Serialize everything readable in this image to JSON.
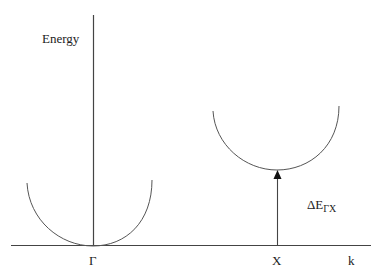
{
  "diagram": {
    "y_axis_label": "Energy",
    "x_axis_label": "k",
    "gamma_label": "Γ",
    "x_point_label": "X",
    "gap_label": {
      "main": "ΔE",
      "sub": "ΓX"
    },
    "line_color": "#444444"
  }
}
